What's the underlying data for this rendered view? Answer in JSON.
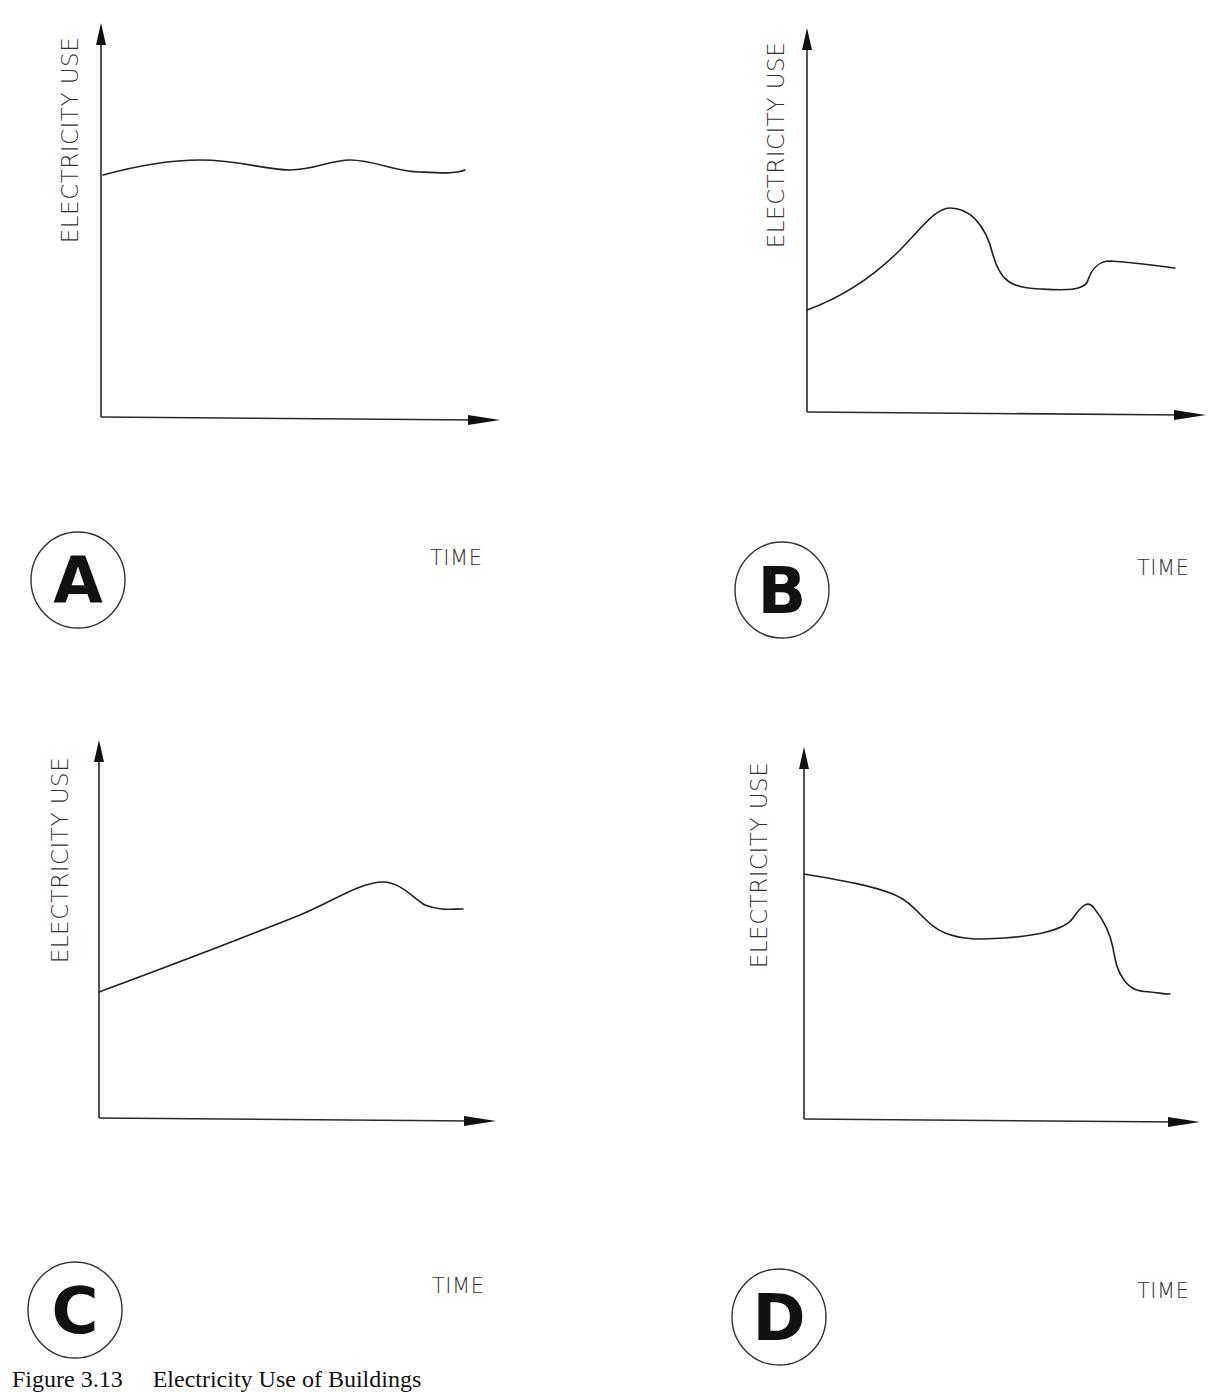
{
  "figure": {
    "caption": "Figure 3.13     Electricity Use of Buildings"
  },
  "colors": {
    "background": "#ffffff",
    "line": "#222222",
    "text": "#333333"
  },
  "panels": [
    {
      "id": "A",
      "badge": "A",
      "ylabel": "ELECTRICITY USE",
      "xlabel": "TIME",
      "origin": [
        101,
        417
      ],
      "yaxis_top": 23,
      "xaxis_right": 500,
      "badge_center": [
        78,
        580
      ],
      "xlabel_pos": [
        430,
        565
      ],
      "ylabel_pos": [
        78,
        140
      ],
      "curve_path": "M103,175 C140,165 170,160 200,160 C240,160 265,170 290,170 C315,170 330,160 350,160 C375,160 395,172 420,172 C440,173 455,174 465,170"
    },
    {
      "id": "B",
      "badge": "B",
      "ylabel": "ELECTRICITY USE",
      "xlabel": "TIME",
      "origin": [
        807,
        412
      ],
      "yaxis_top": 28,
      "xaxis_right": 1206,
      "badge_center": [
        782,
        590
      ],
      "xlabel_pos": [
        1137,
        575
      ],
      "ylabel_pos": [
        784,
        145
      ],
      "curve_path": "M807,310 C840,298 870,280 900,250 C920,230 935,208 950,208 C968,208 985,222 993,255 C1000,280 1010,288 1040,289 C1060,290 1085,292 1088,280 C1092,268 1100,261 1110,261 C1140,263 1160,266 1175,268"
    },
    {
      "id": "C",
      "badge": "C",
      "ylabel": "ELECTRICITY USE",
      "xlabel": "TIME",
      "origin": [
        99,
        1118
      ],
      "yaxis_top": 740,
      "xaxis_right": 496,
      "badge_center": [
        75,
        1310
      ],
      "xlabel_pos": [
        432,
        1293
      ],
      "ylabel_pos": [
        68,
        860
      ],
      "curve_path": "M99,992 C180,962 250,935 300,915 C330,903 360,882 383,882 C400,882 412,897 425,905 C440,911 452,909 463,909"
    },
    {
      "id": "D",
      "badge": "D",
      "ylabel": "ELECTRICITY USE",
      "xlabel": "TIME",
      "origin": [
        804,
        1119
      ],
      "yaxis_top": 747,
      "xaxis_right": 1200,
      "badge_center": [
        779,
        1317
      ],
      "xlabel_pos": [
        1137,
        1298
      ],
      "ylabel_pos": [
        767,
        865
      ],
      "curve_path": "M804,874 C840,880 875,886 895,895 C915,903 925,925 945,933 C965,941 985,939 1005,938 C1035,936 1065,930 1073,918 C1082,905 1088,900 1094,908 C1102,918 1110,932 1113,948 C1116,965 1118,972 1124,980 C1132,991 1140,991 1150,992 C1160,993 1165,994 1170,994"
    }
  ],
  "chart_data": [
    {
      "type": "line",
      "title": "A",
      "xlabel": "TIME",
      "ylabel": "ELECTRICITY USE",
      "grid": false,
      "x": [
        0,
        0.1,
        0.25,
        0.4,
        0.5,
        0.6,
        0.75,
        0.9,
        1.0
      ],
      "values": [
        0.62,
        0.65,
        0.67,
        0.66,
        0.64,
        0.67,
        0.64,
        0.63,
        0.64
      ],
      "description": "Nearly flat, steady electricity use with slight oscillation"
    },
    {
      "type": "line",
      "title": "B",
      "xlabel": "TIME",
      "ylabel": "ELECTRICITY USE",
      "grid": false,
      "x": [
        0,
        0.1,
        0.2,
        0.3,
        0.4,
        0.5,
        0.6,
        0.7,
        0.75,
        0.85,
        1.0
      ],
      "values": [
        0.27,
        0.33,
        0.43,
        0.53,
        0.54,
        0.39,
        0.32,
        0.32,
        0.39,
        0.39,
        0.38
      ],
      "description": "Rises to a peak, drops to a trough, small step up, then gently declines"
    },
    {
      "type": "line",
      "title": "C",
      "xlabel": "TIME",
      "ylabel": "ELECTRICITY USE",
      "grid": false,
      "x": [
        0,
        0.2,
        0.4,
        0.55,
        0.7,
        0.8,
        0.9,
        1.0
      ],
      "values": [
        0.33,
        0.42,
        0.5,
        0.56,
        0.62,
        0.63,
        0.57,
        0.56
      ],
      "description": "Steady linear increase, a peak near the end, then a slight decline"
    },
    {
      "type": "line",
      "title": "D",
      "xlabel": "TIME",
      "ylabel": "ELECTRICITY USE",
      "grid": false,
      "x": [
        0,
        0.15,
        0.3,
        0.45,
        0.6,
        0.72,
        0.78,
        0.85,
        0.9,
        1.0
      ],
      "values": [
        0.66,
        0.62,
        0.54,
        0.49,
        0.5,
        0.55,
        0.58,
        0.42,
        0.34,
        0.33
      ],
      "description": "Gradual decline, shallow trough, sharp spike, then steep drop to a low level"
    }
  ]
}
